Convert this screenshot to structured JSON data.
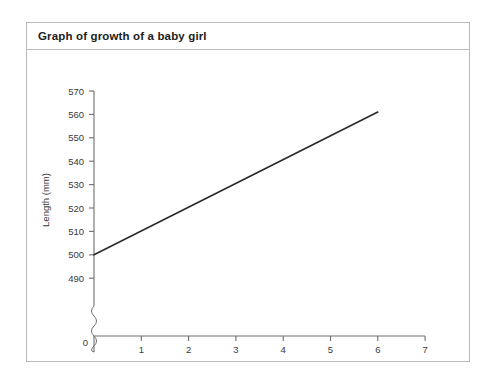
{
  "figure": {
    "title": "Graph of growth of a baby girl"
  },
  "chart_data": {
    "type": "line",
    "title": "Graph of growth of a baby girl",
    "xlabel": "Time (weeks)",
    "ylabel": "Length (mm)",
    "x": [
      0,
      6
    ],
    "values": [
      500,
      561
    ],
    "series": [
      {
        "name": "Length of baby girl",
        "x": [
          0,
          6
        ],
        "values": [
          500,
          561
        ]
      }
    ],
    "xlim": [
      0,
      7
    ],
    "ylim": [
      490,
      570
    ],
    "xticks": [
      0,
      1,
      2,
      3,
      4,
      5,
      6,
      7
    ],
    "xtick_labels": [
      "0",
      "1",
      "2",
      "3",
      "4",
      "5",
      "6",
      "7"
    ],
    "yticks": [
      490,
      500,
      510,
      520,
      530,
      540,
      550,
      560,
      570
    ],
    "ytick_labels": [
      "490",
      "500",
      "510",
      "520",
      "530",
      "540",
      "550",
      "560",
      "570"
    ],
    "y_axis_break": true,
    "y_axis_break_between": [
      0,
      490
    ],
    "grid": false,
    "legend": null,
    "line_color": "#2a2a2a",
    "axis_color": "#6e6e6e"
  },
  "axis": {
    "x_title": "Time (weeks)",
    "y_title": "Length (mm)",
    "x_ticks": [
      "0",
      "1",
      "2",
      "3",
      "4",
      "5",
      "6",
      "7"
    ],
    "y_ticks": [
      "570",
      "560",
      "550",
      "540",
      "530",
      "520",
      "510",
      "500",
      "490"
    ],
    "origin_label": "0"
  }
}
